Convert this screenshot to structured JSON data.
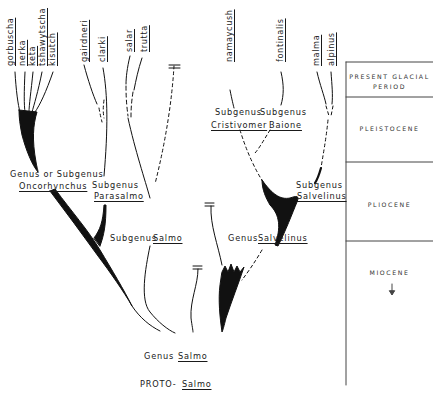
{
  "diagram": {
    "type": "phylogenetic-tree",
    "species_labels": [
      {
        "id": "gorbuscha",
        "text": "gorbuscha"
      },
      {
        "id": "nerka",
        "text": "nerka"
      },
      {
        "id": "keta",
        "text": "keta"
      },
      {
        "id": "tshawytscha",
        "text": "tshawytscha"
      },
      {
        "id": "kisutch",
        "text": "kisutch"
      },
      {
        "id": "gairdneri",
        "text": "gairdneri"
      },
      {
        "id": "clarki",
        "text": "clarki"
      },
      {
        "id": "salar",
        "text": "salar"
      },
      {
        "id": "trutta",
        "text": "trutta"
      },
      {
        "id": "namaycush",
        "text": "namaycush"
      },
      {
        "id": "fontinalis",
        "text": "fontinalis"
      },
      {
        "id": "malma",
        "text": "malma"
      },
      {
        "id": "alpinus",
        "text": "alpinus"
      }
    ],
    "group_labels": {
      "oncorhynchus": {
        "rank": "Genus or Subgenus",
        "name": "Oncorhynchus"
      },
      "parasalmo": {
        "rank": "Subgenus",
        "name": "Parasalmo"
      },
      "salmo_sub": {
        "rank": "Subgenus",
        "name": "Salmo"
      },
      "cristivomer": {
        "rank": "Subgenus",
        "name": "Cristivomer"
      },
      "baione": {
        "rank": "Subgenus",
        "name": "Baione"
      },
      "salvelinus_sub": {
        "rank": "Subgenus",
        "name": "Salvelinus"
      },
      "salvelinus_genus": {
        "rank": "Genus",
        "name": "Salvelinus"
      },
      "salmo_genus": {
        "rank": "Genus",
        "name": "Salmo"
      },
      "proto": {
        "prefix": "PROTO-",
        "name": "Salmo"
      }
    },
    "time_scale": {
      "periods": [
        {
          "id": "present",
          "line1": "PRESENT GLACIAL",
          "line2": "PERIOD"
        },
        {
          "id": "pleistocene",
          "line1": "PLEISTOCENE"
        },
        {
          "id": "pliocene",
          "line1": "PLIOCENE"
        },
        {
          "id": "miocene",
          "line1": "MIOCENE",
          "arrow": "↓"
        }
      ]
    },
    "colors": {
      "ink": "#111111",
      "background": "#ffffff",
      "rule": "#444444"
    }
  }
}
